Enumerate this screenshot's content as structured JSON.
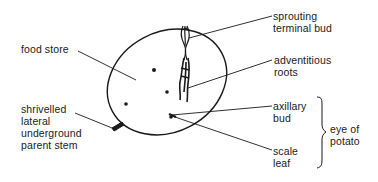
{
  "diagram": {
    "colors": {
      "ink": "#1a1a1a",
      "background": "#ffffff"
    },
    "labels": {
      "food_store": "food store",
      "sprouting_terminal_bud": "sprouting\nterminal bud",
      "adventitious_roots": "adventitious\nroots",
      "shrivelled_stem": "shrivelled\nlateral\nunderground\nparent stem",
      "axillary_bud": "axillary\nbud",
      "scale_leaf": "scale\nleaf",
      "eye_of_potato": "eye of\npotato"
    }
  }
}
